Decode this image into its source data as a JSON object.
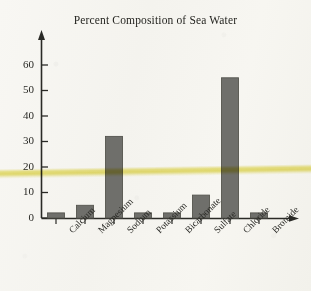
{
  "chart_data": {
    "type": "bar",
    "title": "Percent Composition of Sea Water",
    "xlabel": "",
    "ylabel": "",
    "categories": [
      "Calcium",
      "Magnesium",
      "Sodium",
      "Potassium",
      "Bicarbonate",
      "Sulfate",
      "Chloride",
      "Bromide"
    ],
    "values": [
      2,
      5,
      32,
      2,
      2,
      9,
      55,
      2
    ],
    "ylim": [
      0,
      65
    ],
    "yticks": [
      0,
      10,
      20,
      30,
      40,
      50,
      60
    ],
    "ytick_labels": [
      "0",
      "10",
      "20",
      "30",
      "40",
      "50",
      "60"
    ],
    "grid": false,
    "legend": null,
    "annotations": [
      {
        "kind": "highlighter-stripe",
        "color": "#e7df68",
        "orientation": "horizontal",
        "approx_value": 16
      }
    ],
    "bar_color": "#6f6f6b",
    "bar_edge_color": "#55554f",
    "axis_color": "#2b2b27",
    "background_color": "#f6f5f1"
  }
}
